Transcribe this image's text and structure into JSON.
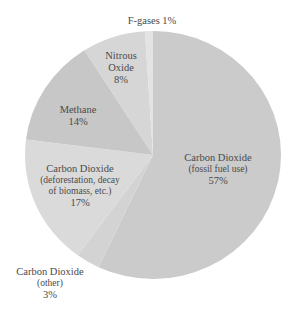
{
  "chart_data": {
    "type": "pie",
    "title": "",
    "start_angle_deg": 0,
    "direction": "clockwise",
    "slices": [
      {
        "name": "Carbon Dioxide",
        "sub": "(fossil fuel use)",
        "pct_label": "57%",
        "value": 57,
        "color": "#cbcbcb"
      },
      {
        "name": "Carbon Dioxide",
        "sub": "(other)",
        "pct_label": "3%",
        "value": 3,
        "color": "#d3d3d3"
      },
      {
        "name": "Carbon Dioxide",
        "sub": "(deforestation, decay of biomass, etc.)",
        "pct_label": "17%",
        "value": 17,
        "color": "#dadada"
      },
      {
        "name": "Methane",
        "sub": "",
        "pct_label": "14%",
        "value": 14,
        "color": "#c7c7c7"
      },
      {
        "name": "Nitrous Oxide",
        "sub": "",
        "pct_label": "8%",
        "value": 8,
        "color": "#d6d6d6"
      },
      {
        "name": "F-gases",
        "sub": "",
        "pct_label": "1%",
        "value": 1,
        "color": "#e3e3e3"
      }
    ]
  },
  "labels": {
    "fgases": "F-gases 1%",
    "nitrous_1": "Nitrous",
    "nitrous_2": "Oxide",
    "nitrous_3": "8%",
    "methane_1": "Methane",
    "methane_2": "14%",
    "defor_1": "Carbon Dioxide",
    "defor_2": "(deforestation, decay",
    "defor_3": "of biomass, etc.)",
    "defor_4": "17%",
    "fossil_1": "Carbon Dioxide",
    "fossil_2": "(fossil fuel use)",
    "fossil_3": "57%",
    "other_1": "Carbon Dioxide",
    "other_2": "(other)",
    "other_3": "3%"
  }
}
